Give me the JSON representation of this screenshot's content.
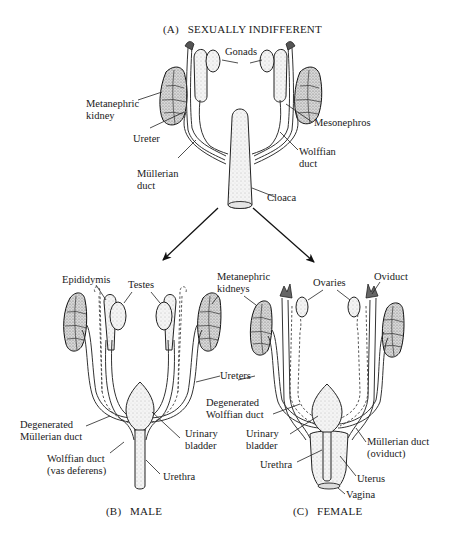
{
  "panels": {
    "indifferent": {
      "caption": "(A)   SEXUALLY INDIFFERENT",
      "labels": {
        "gonads": "Gonads",
        "metanephric_kidney_1": "Metanephric",
        "metanephric_kidney_2": "kidney",
        "mesonephros": "Mesonephros",
        "ureter": "Ureter",
        "wolffian_duct_1": "Wolffian",
        "wolffian_duct_2": "duct",
        "mullerian_duct_1": "Müllerian",
        "mullerian_duct_2": "duct",
        "cloaca": "Cloaca"
      }
    },
    "male": {
      "caption": "(B)   MALE",
      "labels": {
        "epididymis": "Epididymis",
        "testes": "Testes",
        "degenerated_mullerian_1": "Degenerated",
        "degenerated_mullerian_2": "Müllerian duct",
        "urinary_bladder_1": "Urinary",
        "urinary_bladder_2": "bladder",
        "wolffian_vas_1": "Wolffian duct",
        "wolffian_vas_2": "(vas deferens)",
        "urethra": "Urethra"
      }
    },
    "shared": {
      "labels": {
        "metanephric_kidneys_1": "Metanephric",
        "metanephric_kidneys_2": "kidneys",
        "ureters": "Ureters"
      }
    },
    "female": {
      "caption": "(C)   FEMALE",
      "labels": {
        "ovaries": "Ovaries",
        "oviduct": "Oviduct",
        "degenerated_wolffian_1": "Degenerated",
        "degenerated_wolffian_2": "Wolffian duct",
        "urinary_bladder_1": "Urinary",
        "urinary_bladder_2": "bladder",
        "mullerian_oviduct_1": "Müllerian duct",
        "mullerian_oviduct_2": "(oviduct)",
        "urethra": "Urethra",
        "uterus": "Uterus",
        "vagina": "Vagina"
      }
    }
  }
}
